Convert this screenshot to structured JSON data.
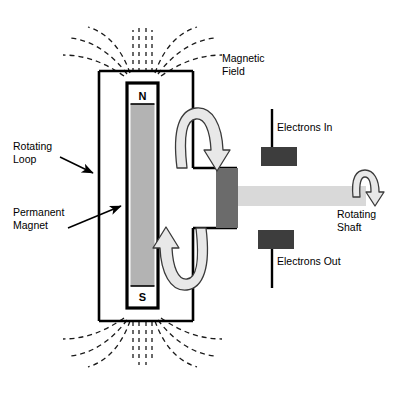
{
  "figure": {
    "background_color": "#ffffff",
    "width": 402,
    "height": 400
  },
  "labels": {
    "magnetic_field": "Magnetic\nField",
    "rotating_loop": "Rotating\nLoop",
    "permanent_magnet": "Permanent\nMagnet",
    "electrons_in": "Electrons In",
    "electrons_out": "Electrons Out",
    "rotating_shaft": "Rotating\nShaft"
  },
  "poles": {
    "north": "N",
    "south": "S"
  },
  "colors": {
    "outline": "#000000",
    "magnet_body": "#b3b3b3",
    "shaft_light": "#d9d9d9",
    "hub_dark": "#6b6b6b",
    "brush_dark": "#3d3d3d",
    "arrow_fill": "#e8e8e8",
    "field_line": "#1a1a1a",
    "background": "#ffffff"
  },
  "parts": {
    "loop_name": "rotating-loop-rectangle",
    "magnet_name": "permanent-magnet-bar",
    "shaft_name": "rotating-shaft-bar",
    "hub_name": "shaft-hub",
    "brush_top_name": "electrons-in-brush",
    "brush_bottom_name": "electrons-out-brush",
    "field_lines_count": 12,
    "rotation_arrows": [
      "loop-rotation-arrow-top",
      "loop-rotation-arrow-bottom",
      "shaft-rotation-arrow"
    ]
  }
}
